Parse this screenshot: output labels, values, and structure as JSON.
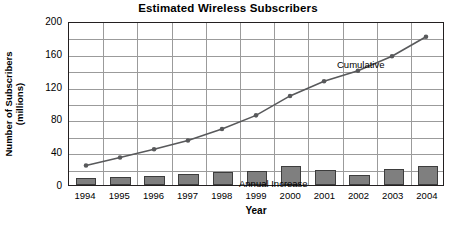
{
  "chart_data": {
    "type": "bar",
    "title": "Estimated Wireless Subscribers",
    "xlabel": "Year",
    "ylabel_line1": "Number of Subscribers",
    "ylabel_line2": "(millions)",
    "categories": [
      "1994",
      "1995",
      "1996",
      "1997",
      "1998",
      "1999",
      "2000",
      "2001",
      "2002",
      "2003",
      "2004"
    ],
    "ylim": [
      0,
      200
    ],
    "yticks": [
      0,
      40,
      80,
      120,
      160,
      200
    ],
    "gridline_step": 20,
    "grid": true,
    "legend_position": "inline-annotations",
    "series": [
      {
        "name": "Annual Increase",
        "type": "bar",
        "color": "#7f7f7f",
        "edge_color": "#3d3d3d",
        "values": [
          9,
          10,
          11,
          14,
          16,
          17,
          23,
          18,
          12,
          19,
          23
        ]
      },
      {
        "name": "Cumulative",
        "type": "line",
        "color": "#58595b",
        "marker": "circle",
        "values": [
          24,
          34,
          44,
          55,
          69,
          86,
          110,
          128,
          141,
          159,
          183
        ]
      }
    ],
    "annotations": [
      {
        "text": "Cumulative",
        "series": "Cumulative"
      },
      {
        "text": "Annual Increase",
        "series": "Annual Increase"
      }
    ]
  }
}
